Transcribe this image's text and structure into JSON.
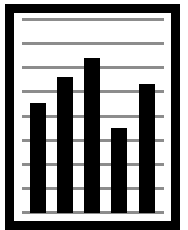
{
  "chart_data": {
    "type": "bar",
    "title": "",
    "xlabel": "",
    "ylabel": "",
    "categories": [
      "1",
      "2",
      "3",
      "4",
      "5"
    ],
    "values": [
      4.5,
      5.6,
      6.4,
      3.5,
      5.3
    ],
    "ylim": [
      0,
      8
    ],
    "grid": true,
    "grid_lines": 9,
    "legend": null,
    "colors": {
      "bar": "#000000",
      "grid": "#8c8c8c",
      "frame": "#000000",
      "background": "#ffffff"
    }
  },
  "layout": {
    "plot_left": 22,
    "plot_right": 164,
    "baseline_y": 212,
    "top_y": 19,
    "bar_x": [
      30,
      57,
      84,
      111,
      139
    ],
    "bar_width": 16
  }
}
